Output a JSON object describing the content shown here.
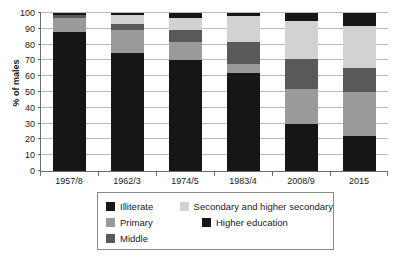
{
  "chart_data": {
    "type": "bar",
    "subtype": "stacked-bar-100",
    "title": "",
    "xlabel": "",
    "ylabel": "% of males",
    "ylim": [
      0,
      100
    ],
    "yticks": [
      0,
      10,
      20,
      30,
      40,
      50,
      60,
      70,
      80,
      90,
      100
    ],
    "grid": true,
    "legend_position": "bottom",
    "categories": [
      "1957/8",
      "1962/3",
      "1974/5",
      "1983/4",
      "2008/9",
      "2015"
    ],
    "series": [
      {
        "name": "Illiterate",
        "color": "#161616",
        "values": [
          88,
          75,
          70.5,
          62,
          30,
          22
        ]
      },
      {
        "name": "Primary",
        "color": "#9a9a9a",
        "values": [
          9,
          14,
          11,
          6,
          22,
          28
        ]
      },
      {
        "name": "Middle",
        "color": "#595959",
        "values": [
          1.5,
          4,
          7.5,
          13.5,
          19,
          15
        ]
      },
      {
        "name": "Secondary and higher secondary",
        "color": "#d2d2d2",
        "values": [
          0.5,
          6,
          8,
          16.5,
          24,
          27
        ]
      },
      {
        "name": "Higher education",
        "color": "#161616",
        "values": [
          1,
          1,
          3,
          2,
          5,
          8
        ]
      }
    ]
  },
  "legend": {
    "rows": [
      [
        {
          "label": "Illiterate",
          "color": "#161616"
        },
        {
          "label": "Secondary and higher secondary",
          "color": "#d2d2d2"
        }
      ],
      [
        {
          "label": "Primary",
          "color": "#9a9a9a"
        },
        {
          "label": "Higher education",
          "color": "#161616"
        }
      ],
      [
        {
          "label": "Middle",
          "color": "#595959"
        }
      ]
    ]
  }
}
